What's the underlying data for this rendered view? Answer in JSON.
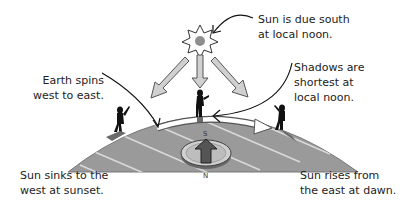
{
  "diagram": {
    "title_implicit": "Sun's apparent motion and Earth rotation",
    "labels": {
      "earth_spins": [
        "Earth spins",
        "west to east."
      ],
      "sun_south": [
        "Sun is due south",
        "at local noon."
      ],
      "shadows": [
        "Shadows are",
        "shortest at",
        "local noon."
      ],
      "sun_sinks": [
        "Sun sinks to the",
        "west at sunset."
      ],
      "sun_rises": [
        "Sun rises from",
        "the east at dawn."
      ]
    },
    "compass": {
      "top_letter": "S",
      "bottom_letter": "N"
    },
    "colors": {
      "earth_fill": "#9a9a9a",
      "earth_stripe": "#d8d8d8",
      "sun_core": "#8f8f8f",
      "ray_fill": "#d0d0d0",
      "figure": "#111111",
      "compass_face": "#c8c8c8",
      "compass_arrow": "#555555"
    }
  }
}
